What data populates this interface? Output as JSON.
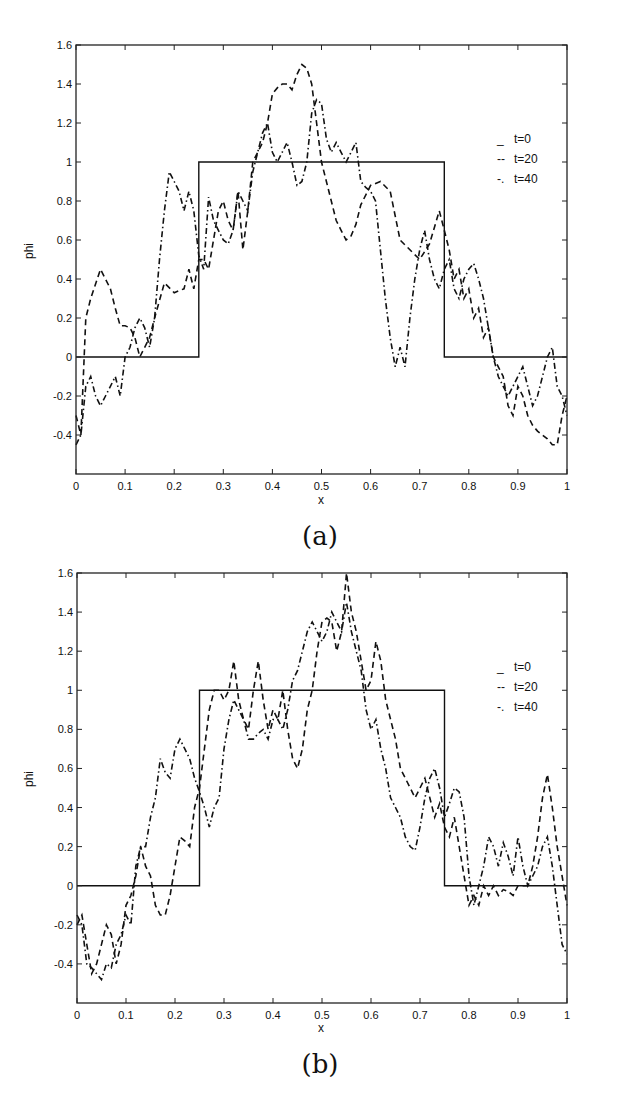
{
  "chart_data": [
    {
      "panel": "(a)",
      "type": "line",
      "title": "",
      "caption": "(a)",
      "xlabel": "x",
      "ylabel": "phi",
      "xlim": [
        0,
        1
      ],
      "ylim": [
        -0.6,
        1.6
      ],
      "xticks": [
        "0",
        "0.1",
        "0.2",
        "0.3",
        "0.4",
        "0.5",
        "0.6",
        "0.7",
        "0.8",
        "0.9",
        "1"
      ],
      "yticks": [
        "-0.4",
        "-0.2",
        "0",
        "0.2",
        "0.4",
        "0.6",
        "0.8",
        "1",
        "1.2",
        "1.4",
        "1.6"
      ],
      "grid": false,
      "legend_position": "upper right",
      "legend": [
        {
          "marker": "_",
          "label": "t=0"
        },
        {
          "marker": "--",
          "label": "t=20"
        },
        {
          "marker": "-.",
          "label": "t=40"
        }
      ],
      "series": [
        {
          "name": "t=0",
          "style": "solid",
          "x": [
            0,
            0.25,
            0.25,
            0.75,
            0.75,
            1
          ],
          "y": [
            0,
            0,
            1,
            1,
            0,
            0
          ]
        },
        {
          "name": "t=20",
          "style": "dashed",
          "x": [
            0,
            0.01,
            0.02,
            0.03,
            0.05,
            0.07,
            0.08,
            0.09,
            0.1,
            0.11,
            0.12,
            0.13,
            0.14,
            0.15,
            0.16,
            0.18,
            0.2,
            0.22,
            0.23,
            0.24,
            0.25,
            0.26,
            0.27,
            0.28,
            0.29,
            0.3,
            0.31,
            0.32,
            0.33,
            0.34,
            0.35,
            0.36,
            0.37,
            0.38,
            0.39,
            0.4,
            0.41,
            0.42,
            0.43,
            0.44,
            0.45,
            0.46,
            0.47,
            0.48,
            0.49,
            0.5,
            0.51,
            0.52,
            0.53,
            0.54,
            0.55,
            0.56,
            0.57,
            0.58,
            0.6,
            0.62,
            0.64,
            0.66,
            0.68,
            0.7,
            0.72,
            0.74,
            0.75,
            0.76,
            0.77,
            0.78,
            0.79,
            0.8,
            0.81,
            0.82,
            0.83,
            0.84,
            0.85,
            0.86,
            0.87,
            0.88,
            0.89,
            0.9,
            0.91,
            0.92,
            0.93,
            0.94,
            0.95,
            0.96,
            0.97,
            0.98,
            0.99,
            1
          ],
          "y": [
            -0.3,
            -0.4,
            0.2,
            0.3,
            0.45,
            0.35,
            0.25,
            0.16,
            0.16,
            0.15,
            0.1,
            0.0,
            0.05,
            0.1,
            0.2,
            0.38,
            0.33,
            0.35,
            0.45,
            0.35,
            0.5,
            0.5,
            0.45,
            0.6,
            0.75,
            0.8,
            0.7,
            0.65,
            0.85,
            0.55,
            0.75,
            1.0,
            1.05,
            1.1,
            1.2,
            1.35,
            1.38,
            1.4,
            1.4,
            1.37,
            1.45,
            1.5,
            1.48,
            1.4,
            1.2,
            1.0,
            0.9,
            0.8,
            0.7,
            0.65,
            0.6,
            0.62,
            0.68,
            0.78,
            0.88,
            0.9,
            0.85,
            0.6,
            0.55,
            0.5,
            0.58,
            0.75,
            0.65,
            0.55,
            0.4,
            0.45,
            0.3,
            0.35,
            0.2,
            0.25,
            0.1,
            0.15,
            0.0,
            -0.05,
            -0.1,
            -0.25,
            -0.3,
            -0.15,
            -0.2,
            -0.3,
            -0.35,
            -0.38,
            -0.4,
            -0.42,
            -0.45,
            -0.45,
            -0.3,
            -0.2
          ]
        },
        {
          "name": "t=40",
          "style": "dashdot",
          "x": [
            0,
            0.01,
            0.02,
            0.03,
            0.04,
            0.05,
            0.06,
            0.07,
            0.08,
            0.09,
            0.1,
            0.11,
            0.12,
            0.13,
            0.14,
            0.15,
            0.16,
            0.17,
            0.18,
            0.19,
            0.2,
            0.21,
            0.22,
            0.23,
            0.24,
            0.25,
            0.26,
            0.27,
            0.28,
            0.29,
            0.3,
            0.31,
            0.32,
            0.33,
            0.34,
            0.35,
            0.36,
            0.37,
            0.38,
            0.39,
            0.4,
            0.41,
            0.42,
            0.43,
            0.44,
            0.45,
            0.46,
            0.47,
            0.48,
            0.49,
            0.5,
            0.51,
            0.52,
            0.53,
            0.54,
            0.55,
            0.56,
            0.57,
            0.58,
            0.59,
            0.6,
            0.61,
            0.62,
            0.63,
            0.64,
            0.65,
            0.66,
            0.67,
            0.68,
            0.69,
            0.7,
            0.71,
            0.72,
            0.73,
            0.74,
            0.75,
            0.76,
            0.77,
            0.78,
            0.79,
            0.8,
            0.81,
            0.82,
            0.83,
            0.84,
            0.85,
            0.86,
            0.87,
            0.88,
            0.89,
            0.9,
            0.91,
            0.92,
            0.93,
            0.94,
            0.95,
            0.96,
            0.97,
            0.98,
            0.99,
            1
          ],
          "y": [
            -0.45,
            -0.4,
            -0.15,
            -0.1,
            -0.2,
            -0.25,
            -0.2,
            -0.15,
            -0.1,
            -0.2,
            0.0,
            0.05,
            0.15,
            0.2,
            0.15,
            0.05,
            0.2,
            0.5,
            0.75,
            0.95,
            0.9,
            0.85,
            0.75,
            0.85,
            0.75,
            0.52,
            0.45,
            0.82,
            0.7,
            0.65,
            0.6,
            0.58,
            0.65,
            0.85,
            0.8,
            0.75,
            0.95,
            1.05,
            1.15,
            1.2,
            1.05,
            1.0,
            1.05,
            1.1,
            1.0,
            0.88,
            0.9,
            1.0,
            1.25,
            1.32,
            1.3,
            1.12,
            1.05,
            1.1,
            1.05,
            1.0,
            1.05,
            1.1,
            0.9,
            0.87,
            0.85,
            0.8,
            0.55,
            0.3,
            0.1,
            -0.05,
            0.05,
            -0.05,
            0.2,
            0.4,
            0.55,
            0.65,
            0.5,
            0.4,
            0.35,
            0.45,
            0.5,
            0.35,
            0.3,
            0.4,
            0.45,
            0.48,
            0.4,
            0.3,
            0.15,
            0.0,
            -0.1,
            -0.15,
            -0.2,
            -0.15,
            -0.1,
            -0.05,
            -0.15,
            -0.25,
            -0.2,
            -0.1,
            0.0,
            0.05,
            -0.15,
            -0.2,
            -0.3
          ]
        }
      ]
    },
    {
      "panel": "(b)",
      "type": "line",
      "title": "",
      "caption": "(b)",
      "xlabel": "x",
      "ylabel": "phi",
      "xlim": [
        0,
        1
      ],
      "ylim": [
        -0.6,
        1.6
      ],
      "xticks": [
        "0",
        "0.1",
        "0.2",
        "0.3",
        "0.4",
        "0.5",
        "0.6",
        "0.7",
        "0.8",
        "0.9",
        "1"
      ],
      "yticks": [
        "-0.4",
        "-0.2",
        "0",
        "0.2",
        "0.4",
        "0.6",
        "0.8",
        "1",
        "1.2",
        "1.4",
        "1.6"
      ],
      "grid": false,
      "legend_position": "upper right",
      "legend": [
        {
          "marker": "_",
          "label": "t=0"
        },
        {
          "marker": "--",
          "label": "t=20"
        },
        {
          "marker": "-.",
          "label": "t=40"
        }
      ],
      "series": [
        {
          "name": "t=0",
          "style": "solid",
          "x": [
            0,
            0.25,
            0.25,
            0.75,
            0.75,
            1
          ],
          "y": [
            0,
            0,
            1,
            1,
            0,
            0
          ]
        },
        {
          "name": "t=20",
          "style": "dashed",
          "x": [
            0,
            0.01,
            0.02,
            0.03,
            0.04,
            0.05,
            0.06,
            0.07,
            0.08,
            0.09,
            0.1,
            0.11,
            0.12,
            0.13,
            0.14,
            0.15,
            0.16,
            0.17,
            0.18,
            0.19,
            0.2,
            0.21,
            0.22,
            0.23,
            0.24,
            0.25,
            0.26,
            0.27,
            0.28,
            0.29,
            0.3,
            0.31,
            0.32,
            0.33,
            0.34,
            0.35,
            0.36,
            0.37,
            0.38,
            0.39,
            0.4,
            0.41,
            0.42,
            0.43,
            0.44,
            0.45,
            0.46,
            0.47,
            0.48,
            0.49,
            0.5,
            0.51,
            0.52,
            0.53,
            0.54,
            0.55,
            0.56,
            0.57,
            0.58,
            0.59,
            0.6,
            0.61,
            0.62,
            0.63,
            0.64,
            0.65,
            0.66,
            0.67,
            0.68,
            0.69,
            0.7,
            0.71,
            0.72,
            0.73,
            0.74,
            0.75,
            0.76,
            0.77,
            0.78,
            0.79,
            0.8,
            0.81,
            0.82,
            0.83,
            0.84,
            0.85,
            0.86,
            0.87,
            0.88,
            0.89,
            0.9,
            0.91,
            0.92,
            0.93,
            0.94,
            0.95,
            0.96,
            0.97,
            0.98,
            0.99,
            1
          ],
          "y": [
            -0.2,
            -0.15,
            -0.3,
            -0.45,
            -0.4,
            -0.3,
            -0.2,
            -0.25,
            -0.4,
            -0.3,
            -0.1,
            -0.05,
            0.05,
            0.2,
            0.1,
            0.05,
            -0.1,
            -0.15,
            -0.15,
            -0.05,
            0.1,
            0.25,
            0.23,
            0.2,
            0.4,
            0.5,
            0.7,
            0.9,
            1.0,
            1.0,
            0.95,
            1.0,
            1.15,
            0.95,
            0.85,
            0.8,
            1.0,
            1.15,
            0.95,
            0.8,
            0.9,
            0.85,
            1.0,
            0.8,
            0.65,
            0.6,
            0.7,
            0.9,
            1.0,
            1.2,
            1.35,
            1.37,
            1.35,
            1.2,
            1.3,
            1.6,
            1.4,
            1.3,
            1.15,
            1.0,
            1.05,
            1.25,
            1.15,
            0.95,
            0.85,
            0.75,
            0.6,
            0.55,
            0.5,
            0.45,
            0.5,
            0.55,
            0.45,
            0.35,
            0.42,
            0.3,
            0.25,
            0.35,
            0.2,
            0.05,
            -0.1,
            -0.05,
            -0.1,
            0.0,
            -0.05,
            0.0,
            -0.05,
            -0.02,
            -0.03,
            -0.05,
            0.0,
            0.0,
            0.0,
            0.1,
            0.25,
            0.45,
            0.57,
            0.4,
            0.2,
            0.05,
            -0.1
          ]
        },
        {
          "name": "t=40",
          "style": "dashdot",
          "x": [
            0,
            0.01,
            0.02,
            0.03,
            0.04,
            0.05,
            0.06,
            0.07,
            0.08,
            0.09,
            0.1,
            0.11,
            0.12,
            0.13,
            0.14,
            0.15,
            0.16,
            0.17,
            0.18,
            0.19,
            0.2,
            0.21,
            0.22,
            0.23,
            0.24,
            0.25,
            0.26,
            0.27,
            0.28,
            0.29,
            0.3,
            0.31,
            0.32,
            0.33,
            0.34,
            0.35,
            0.36,
            0.37,
            0.38,
            0.39,
            0.4,
            0.41,
            0.42,
            0.43,
            0.44,
            0.45,
            0.46,
            0.47,
            0.48,
            0.49,
            0.5,
            0.51,
            0.52,
            0.53,
            0.54,
            0.55,
            0.56,
            0.57,
            0.58,
            0.59,
            0.6,
            0.61,
            0.62,
            0.63,
            0.64,
            0.65,
            0.66,
            0.67,
            0.68,
            0.69,
            0.7,
            0.71,
            0.72,
            0.73,
            0.74,
            0.75,
            0.76,
            0.77,
            0.78,
            0.79,
            0.8,
            0.81,
            0.82,
            0.83,
            0.84,
            0.85,
            0.86,
            0.87,
            0.88,
            0.89,
            0.9,
            0.91,
            0.92,
            0.93,
            0.94,
            0.95,
            0.96,
            0.97,
            0.98,
            0.99,
            1
          ],
          "y": [
            -0.15,
            -0.2,
            -0.4,
            -0.42,
            -0.45,
            -0.48,
            -0.4,
            -0.42,
            -0.3,
            -0.25,
            -0.15,
            -0.2,
            0.1,
            0.2,
            0.2,
            0.35,
            0.45,
            0.65,
            0.58,
            0.55,
            0.7,
            0.75,
            0.7,
            0.65,
            0.55,
            0.48,
            0.4,
            0.3,
            0.4,
            0.45,
            0.7,
            0.85,
            0.95,
            0.9,
            0.85,
            0.75,
            0.75,
            0.78,
            0.8,
            0.75,
            0.85,
            0.85,
            0.8,
            0.9,
            1.05,
            1.1,
            1.2,
            1.3,
            1.35,
            1.3,
            1.25,
            1.3,
            1.4,
            1.35,
            1.3,
            1.45,
            1.3,
            1.2,
            1.1,
            0.9,
            0.8,
            0.85,
            0.7,
            0.6,
            0.45,
            0.4,
            0.35,
            0.25,
            0.2,
            0.18,
            0.3,
            0.45,
            0.55,
            0.6,
            0.5,
            0.35,
            0.42,
            0.5,
            0.48,
            0.35,
            0.05,
            -0.1,
            0.0,
            0.1,
            0.25,
            0.2,
            0.1,
            0.22,
            0.15,
            0.05,
            0.25,
            0.1,
            0.0,
            0.05,
            0.1,
            0.2,
            0.25,
            0.1,
            -0.1,
            -0.3,
            -0.35
          ]
        }
      ]
    }
  ],
  "figure": {
    "panels": [
      {
        "caption": "(a)",
        "xlabel": "x",
        "ylabel": "phi"
      },
      {
        "caption": "(b)",
        "xlabel": "x",
        "ylabel": "phi"
      }
    ]
  }
}
